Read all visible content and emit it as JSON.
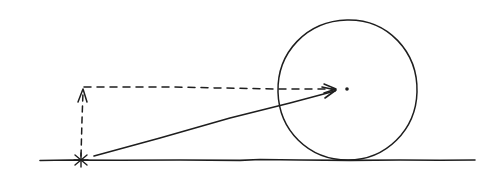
{
  "diagram": {
    "colors": {
      "ink": "#1e1e1e",
      "background": "#ffffff"
    },
    "elements": {
      "ground_line": {
        "x1": 40,
        "y1": 160,
        "x2": 475,
        "y2": 160
      },
      "circle": {
        "cx": 347,
        "cy": 90,
        "r": 70
      },
      "center_dot": {
        "cx": 347,
        "cy": 89
      },
      "origin_marker": {
        "shape": "asterisk",
        "cx": 81,
        "cy": 160
      },
      "diagonal_vector": {
        "from": [
          94,
          156
        ],
        "to": [
          337,
          90
        ]
      },
      "vertical_dashed_component": {
        "from": [
          81,
          157
        ],
        "to": [
          83,
          88
        ]
      },
      "horizontal_dashed_component": {
        "from": [
          83,
          87
        ],
        "to": [
          337,
          89
        ]
      }
    },
    "labels": []
  }
}
